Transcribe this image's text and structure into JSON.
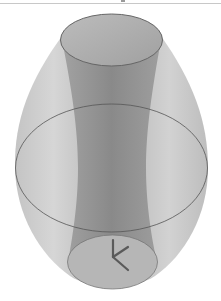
{
  "scene": {
    "description": "3D render of a translucent barrel-shaped solid (ellipsoid of revolution) with an inner hyperboloid tube and a coordinate axis triad at the bottom",
    "background_color": "#ffffff",
    "outer_solid": {
      "shape": "barrel",
      "fill_color": "#b8b8b8",
      "edge_color": "#6a6a6a"
    },
    "inner_tube": {
      "shape": "hyperboloid",
      "fill_color": "#8c8c8c"
    },
    "top_cap": {
      "shape": "ellipse",
      "fill_color": "#a8a8a8"
    },
    "equator_ring": {
      "shape": "ellipse",
      "stroke_color": "#555555"
    },
    "bottom_cap": {
      "shape": "ellipse",
      "fill_color": "#b0b0b0"
    },
    "axis_triad": {
      "color": "#5a5a5a",
      "axes": [
        "x",
        "y",
        "z"
      ]
    }
  }
}
